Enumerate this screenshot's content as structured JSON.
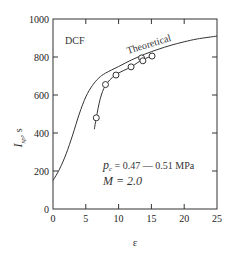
{
  "chart_data": {
    "type": "line",
    "title": "",
    "xlabel": "ε",
    "ylabel": "I_sp, s",
    "ylabel_main": "I",
    "ylabel_sub": "sp",
    "ylabel_unit": ", s",
    "xlim": [
      0,
      25
    ],
    "ylim": [
      0,
      1000
    ],
    "xticks": [
      0,
      5,
      10,
      15,
      20,
      25
    ],
    "yticks": [
      0,
      200,
      400,
      600,
      800,
      1000
    ],
    "grid": false,
    "annotations": {
      "dcf": "DCF",
      "theoretical": "Theoretical",
      "pc_symbol": "p",
      "pc_sub": "c",
      "pc_text": " = 0.47 — 0.51 MPa",
      "mach": "M = 2.0"
    },
    "series": [
      {
        "name": "Theoretical",
        "style": "line",
        "x": [
          0,
          1,
          2,
          3,
          4,
          5,
          6,
          7,
          8,
          10,
          12,
          14,
          16,
          18,
          20,
          22,
          25
        ],
        "y": [
          150,
          210,
          290,
          390,
          500,
          590,
          650,
          690,
          715,
          750,
          785,
          815,
          840,
          862,
          880,
          895,
          910
        ]
      },
      {
        "name": "Experimental fit",
        "style": "line",
        "x": [
          6.3,
          6.6,
          7.2,
          8.0,
          9.5,
          11.9,
          13.6,
          15.4
        ],
        "y": [
          420,
          480,
          580,
          650,
          705,
          748,
          785,
          808
        ]
      },
      {
        "name": "Experimental",
        "style": "markers",
        "x": [
          6.6,
          8.0,
          9.6,
          11.9,
          13.5,
          13.7,
          15.1
        ],
        "y": [
          480,
          655,
          705,
          748,
          795,
          780,
          805
        ]
      }
    ]
  }
}
